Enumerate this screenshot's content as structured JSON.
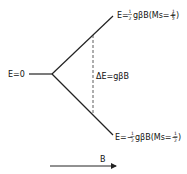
{
  "diagram": {
    "levels": {
      "zero": {
        "label": "E=0"
      },
      "upper": {
        "label_prefix": "E=",
        "fraction_num": "1",
        "fraction_den": "2",
        "label_mid": "gβB(Ms=+",
        "ms_num": "1",
        "ms_den": "2",
        "label_suffix": ")"
      },
      "lower": {
        "label_prefix": "E=−",
        "fraction_num": "1",
        "fraction_den": "2",
        "label_mid": "gβB(Ms=−",
        "ms_num": "1",
        "ms_den": "2",
        "label_suffix": ")"
      }
    },
    "gap": {
      "label": "ΔE=gβB"
    },
    "axis": {
      "label": "B"
    }
  }
}
